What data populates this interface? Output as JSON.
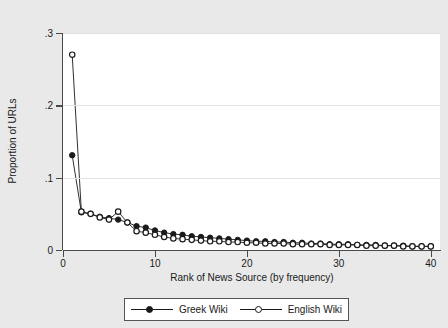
{
  "chart_data": {
    "type": "line",
    "title": "",
    "xlabel": "Rank of News Source (by frequency)",
    "ylabel": "Proportion of URLs",
    "xlim": [
      0,
      41
    ],
    "ylim": [
      0,
      0.3
    ],
    "xticks": [
      "0",
      "10",
      "20",
      "30",
      "40"
    ],
    "xtick_values": [
      0,
      10,
      20,
      30,
      40
    ],
    "yticks": [
      "0",
      ".1",
      ".2",
      ".3"
    ],
    "ytick_values": [
      0,
      0.1,
      0.2,
      0.3
    ],
    "grid": "horizontal",
    "legend_position": "below",
    "x": [
      1,
      2,
      3,
      4,
      5,
      6,
      7,
      8,
      9,
      10,
      11,
      12,
      13,
      14,
      15,
      16,
      17,
      18,
      19,
      20,
      21,
      22,
      23,
      24,
      25,
      26,
      27,
      28,
      29,
      30,
      31,
      32,
      33,
      34,
      35,
      36,
      37,
      38,
      39,
      40
    ],
    "series": [
      {
        "name": "Greek Wiki",
        "marker": "filled-circle",
        "color": "#1a1a1a",
        "values": [
          0.131,
          0.052,
          0.05,
          0.046,
          0.044,
          0.042,
          0.038,
          0.033,
          0.031,
          0.027,
          0.024,
          0.022,
          0.021,
          0.019,
          0.018,
          0.017,
          0.016,
          0.015,
          0.014,
          0.013,
          0.012,
          0.012,
          0.011,
          0.011,
          0.01,
          0.01,
          0.009,
          0.009,
          0.008,
          0.008,
          0.008,
          0.007,
          0.007,
          0.007,
          0.006,
          0.006,
          0.006,
          0.005,
          0.005,
          0.005
        ]
      },
      {
        "name": "English Wiki",
        "marker": "hollow-circle",
        "color": "#1a1a1a",
        "values": [
          0.27,
          0.053,
          0.05,
          0.045,
          0.042,
          0.053,
          0.038,
          0.026,
          0.024,
          0.021,
          0.018,
          0.016,
          0.015,
          0.014,
          0.013,
          0.012,
          0.012,
          0.011,
          0.011,
          0.01,
          0.01,
          0.009,
          0.009,
          0.009,
          0.008,
          0.008,
          0.008,
          0.008,
          0.007,
          0.007,
          0.007,
          0.007,
          0.006,
          0.006,
          0.006,
          0.006,
          0.005,
          0.005,
          0.005,
          0.005
        ]
      }
    ]
  },
  "legend": {
    "entries": [
      {
        "label": "Greek Wiki"
      },
      {
        "label": "English Wiki"
      }
    ]
  }
}
